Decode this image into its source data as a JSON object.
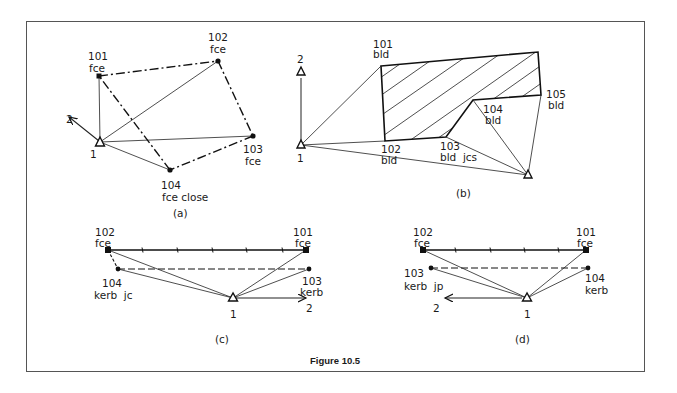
{
  "figure": {
    "caption": "Figure 10.5",
    "frame_color": "#555555"
  },
  "panels": {
    "a": {
      "label": "(a)",
      "station": "1",
      "orientation": "2",
      "points": [
        {
          "id": "101",
          "code": "fce"
        },
        {
          "id": "102",
          "code": "fce"
        },
        {
          "id": "103",
          "code": "fce"
        },
        {
          "id": "104",
          "code": "fce close"
        }
      ]
    },
    "b": {
      "label": "(b)",
      "station": "1",
      "orientation": "2",
      "points": [
        {
          "id": "101",
          "code": "bld"
        },
        {
          "id": "102",
          "code": "bld"
        },
        {
          "id": "103",
          "code": "bld  jcs"
        },
        {
          "id": "104",
          "code": "bld"
        },
        {
          "id": "105",
          "code": "bld"
        }
      ]
    },
    "c": {
      "label": "(c)",
      "station": "1",
      "orientation": "2",
      "points": [
        {
          "id": "102",
          "code": "fce"
        },
        {
          "id": "101",
          "code": "fce"
        },
        {
          "id": "104",
          "code": "kerb  jc"
        },
        {
          "id": "103",
          "code": "kerb"
        }
      ]
    },
    "d": {
      "label": "(d)",
      "station": "1",
      "orientation": "2",
      "points": [
        {
          "id": "102",
          "code": "fce"
        },
        {
          "id": "101",
          "code": "fce"
        },
        {
          "id": "103",
          "code": "kerb  jp"
        },
        {
          "id": "104",
          "code": "kerb"
        }
      ]
    }
  }
}
